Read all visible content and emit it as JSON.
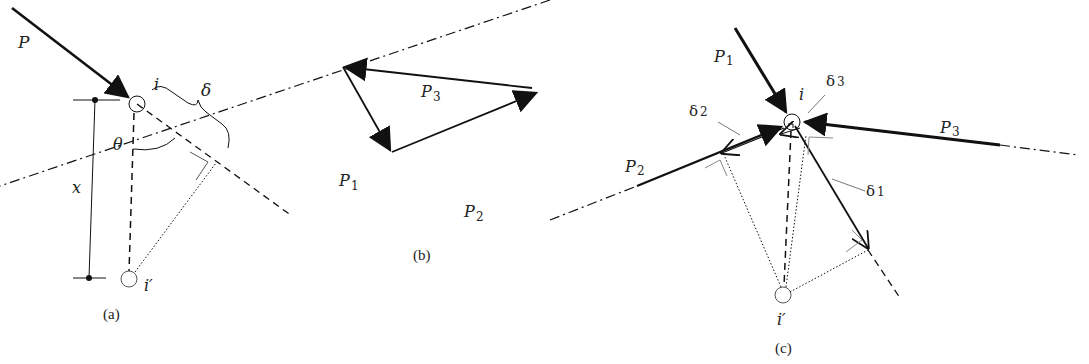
{
  "panels": {
    "a": {
      "caption": "(a)",
      "labels": {
        "force": "P",
        "node": "i",
        "node_image": "i′",
        "angle": "θ",
        "distance": "x",
        "displacement": "δ"
      }
    },
    "b": {
      "caption": "(b)",
      "labels": {
        "p1": "P",
        "p1_sub": "1",
        "p2": "P",
        "p2_sub": "2",
        "p3": "P",
        "p3_sub": "3"
      }
    },
    "c": {
      "caption": "(c)",
      "labels": {
        "node": "i",
        "node_image": "i′",
        "p1": "P",
        "p1_sub": "1",
        "p2": "P",
        "p2_sub": "2",
        "p3": "P",
        "p3_sub": "3",
        "d1": "δ",
        "d1_sub": "1",
        "d2": "δ",
        "d2_sub": "2",
        "d3": "δ",
        "d3_sub": "3"
      }
    }
  },
  "colors": {
    "stroke": "#111111",
    "light_stroke": "#777777",
    "background": "#ffffff"
  }
}
